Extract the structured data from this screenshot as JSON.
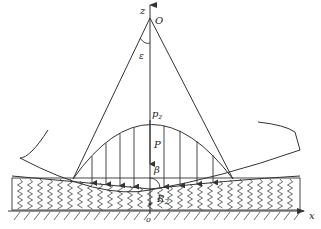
{
  "diagram": {
    "labels": {
      "z_axis": "z",
      "x_axis": "x",
      "origin_top": "O",
      "angle_epsilon": "ε",
      "peak_pressure": "p",
      "peak_pressure_sub": "z",
      "load": "P",
      "angle_beta": "β",
      "radius": "R",
      "radius_sub": "2",
      "origin_bottom": "o"
    },
    "colors": {
      "line": "#333333",
      "text": "#222222",
      "background": "#ffffff"
    }
  }
}
